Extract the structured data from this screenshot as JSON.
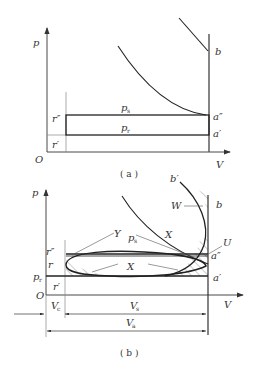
{
  "figure_a": {
    "caption": "( a )",
    "axis_y_label": "p",
    "axis_x_label": "V",
    "origin_label": "O",
    "labels": {
      "b": "b",
      "a_double": "a″",
      "a_single": "a′",
      "r_double": "r″",
      "r_single": "r′",
      "ps": "p",
      "ps_sub": "s",
      "pr": "p",
      "pr_sub": "r"
    }
  },
  "figure_b": {
    "caption": "( b )",
    "axis_y_label": "p",
    "axis_x_label": "V",
    "origin_label": "O",
    "labels": {
      "b_prime": "b′",
      "b": "b",
      "W": "W",
      "U": "U",
      "X_upper": "X",
      "X_lower": "X",
      "Y": "Y",
      "ps": "p",
      "ps_sub": "s",
      "pr": "p",
      "pr_sub": "r",
      "a_double": "a″",
      "a_single": "a′",
      "r_double": "r″",
      "r": "r",
      "r_single": "r′",
      "Vc": "V",
      "Vc_sub": "c",
      "Vs": "V",
      "Vs_sub": "s",
      "Va": "V",
      "Va_sub": "a"
    }
  }
}
